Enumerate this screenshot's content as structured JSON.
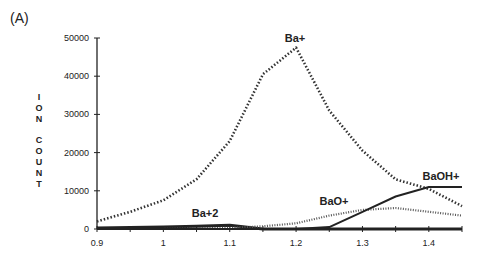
{
  "panel_label": "(A)",
  "chart_data": {
    "type": "line",
    "title": "",
    "xlabel": "",
    "ylabel": "ION COUNT",
    "xlim": [
      0.9,
      1.45
    ],
    "ylim": [
      0,
      50000
    ],
    "x": [
      0.9,
      0.95,
      1.0,
      1.05,
      1.1,
      1.15,
      1.2,
      1.25,
      1.3,
      1.35,
      1.4,
      1.45
    ],
    "x_ticks": [
      0.9,
      1.0,
      1.1,
      1.2,
      1.3,
      1.4
    ],
    "x_tick_labels": [
      "0.9",
      "1",
      "1.1",
      "1.2",
      "1.3",
      "1.4"
    ],
    "y_ticks": [
      0,
      10000,
      20000,
      30000,
      40000,
      50000
    ],
    "y_tick_labels": [
      "0",
      "10000",
      "20000",
      "30000",
      "40000",
      "50000"
    ],
    "grid": false,
    "legend": "inline labels",
    "series": [
      {
        "name": "Ba+",
        "label": "Ba+",
        "style": "dashed-heavy",
        "values": [
          2000,
          4500,
          7500,
          13000,
          23000,
          40500,
          47500,
          31000,
          20500,
          13000,
          10500,
          6000
        ]
      },
      {
        "name": "Ba+2",
        "label": "Ba+2",
        "style": "solid-heavy",
        "values": [
          300,
          400,
          500,
          700,
          1000,
          0,
          0,
          0,
          0,
          0,
          0,
          0
        ]
      },
      {
        "name": "BaO+",
        "label": "BaO+",
        "style": "dotted",
        "values": [
          0,
          0,
          0,
          200,
          300,
          700,
          1500,
          3500,
          5000,
          5500,
          4500,
          3500
        ]
      },
      {
        "name": "BaOH+",
        "label": "BaOH+",
        "style": "solid",
        "values": [
          0,
          0,
          0,
          0,
          0,
          0,
          0,
          500,
          4500,
          8500,
          11000,
          11000
        ]
      }
    ]
  },
  "y_axis_letters": [
    "I",
    "O",
    "N",
    "",
    "C",
    "O",
    "U",
    "N",
    "T"
  ]
}
